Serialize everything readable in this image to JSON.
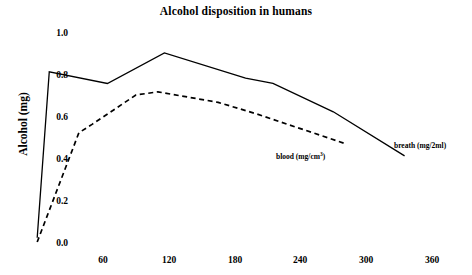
{
  "chart_data": {
    "type": "line",
    "title": "Alcohol disposition in humans",
    "xlabel": "",
    "ylabel": "Alcohol (mg)",
    "xlim": [
      0,
      380
    ],
    "ylim": [
      0.0,
      1.0
    ],
    "grid": false,
    "legend_position": "inline-annotation",
    "xticks": [
      60,
      120,
      180,
      240,
      300,
      360
    ],
    "xtick_labels": [
      "60",
      "120",
      "180",
      "240",
      "300",
      "360"
    ],
    "yticks": [
      0.0,
      0.2,
      0.4,
      0.6,
      0.8,
      1.0
    ],
    "ytick_labels": [
      "0.0",
      "0.2",
      "0.4",
      "0.6",
      "0.8",
      "1.0"
    ],
    "series": [
      {
        "name": "breath (mg/2ml)",
        "label_html": "breath (mg/2ml)",
        "style": "solid",
        "color": "#000000",
        "x": [
          0,
          11,
          64,
          116,
          190,
          215,
          270,
          335
        ],
        "y": [
          0.02,
          0.81,
          0.755,
          0.9,
          0.78,
          0.755,
          0.62,
          0.41
        ]
      },
      {
        "name": "blood (mg/cm3)",
        "label_prefix": "blood (mg/cm",
        "label_sup": "3",
        "label_suffix": ")",
        "style": "dashed",
        "color": "#000000",
        "x": [
          0,
          38,
          50,
          90,
          110,
          165,
          200,
          280
        ],
        "y": [
          0.0,
          0.52,
          0.56,
          0.7,
          0.715,
          0.665,
          0.61,
          0.47
        ]
      }
    ]
  },
  "annotations": {
    "blood_label_x": 276,
    "blood_label_y": 152,
    "breath_label_x": 394,
    "breath_label_y": 141
  }
}
